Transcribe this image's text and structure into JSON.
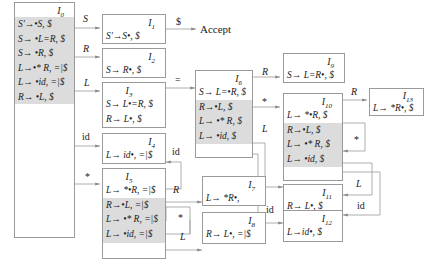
{
  "diagram": {
    "type": "LR(1) automaton",
    "accept_label": "Accept",
    "states": [
      {
        "id": "I0",
        "name": "I",
        "sub": "0",
        "kernel": [
          "S'→•S, $"
        ],
        "closure": [
          "S→ •L=R, $",
          "S→ •R, $",
          "L→•* R, =|$",
          "L→ •id, =|$",
          "R→ •L, $"
        ]
      },
      {
        "id": "I1",
        "name": "I",
        "sub": "1",
        "kernel": [
          "S'→S•, $"
        ],
        "closure": []
      },
      {
        "id": "I2",
        "name": "I",
        "sub": "2",
        "kernel": [
          "S→ R•, $"
        ],
        "closure": []
      },
      {
        "id": "I3",
        "name": "I",
        "sub": "3",
        "kernel": [
          "S→ L•=R, $",
          "R→ L•, $"
        ],
        "closure": []
      },
      {
        "id": "I4",
        "name": "I",
        "sub": "4",
        "kernel": [
          "L→ id•, =|$"
        ],
        "closure": []
      },
      {
        "id": "I5",
        "name": "I",
        "sub": "5",
        "kernel": [
          "L→ *•R, =|$"
        ],
        "closure": [
          "R→•L, =|$",
          "L→ •* R, =|$",
          "L→ •id, =|$"
        ]
      },
      {
        "id": "I6",
        "name": "I",
        "sub": "6",
        "kernel": [
          "S→ L=•R, $"
        ],
        "closure": [
          "R→•L, $",
          "L→ •* R, $",
          "L→ •id, $"
        ]
      },
      {
        "id": "I7",
        "name": "I",
        "sub": "7",
        "kernel": [
          "L→ *R•,"
        ],
        "closure": []
      },
      {
        "id": "I8",
        "name": "I",
        "sub": "8",
        "kernel": [
          "R→ L•, =|$"
        ],
        "closure": []
      },
      {
        "id": "I9",
        "name": "I",
        "sub": "9",
        "kernel": [
          "S→ L=R•, $"
        ],
        "closure": []
      },
      {
        "id": "I10",
        "name": "I",
        "sub": "10",
        "kernel": [
          "L→ *•R, $"
        ],
        "closure": [
          "R→•L, $",
          "L→ •* R, $",
          "L→ •id, $"
        ]
      },
      {
        "id": "I11",
        "name": "I",
        "sub": "11",
        "kernel": [
          "R→ L•, $"
        ],
        "closure": []
      },
      {
        "id": "I12",
        "name": "I",
        "sub": "12",
        "kernel": [
          "L→id•, $"
        ],
        "closure": []
      },
      {
        "id": "I13",
        "name": "I",
        "sub": "13",
        "kernel": [
          "L→ *R•, $"
        ],
        "closure": []
      }
    ],
    "transitions": [
      {
        "from": "I0",
        "to": "I1",
        "symbol": "S"
      },
      {
        "from": "I0",
        "to": "I2",
        "symbol": "R"
      },
      {
        "from": "I0",
        "to": "I3",
        "symbol": "L"
      },
      {
        "from": "I0",
        "to": "I4",
        "symbol": "id"
      },
      {
        "from": "I0",
        "to": "I5",
        "symbol": "*"
      },
      {
        "from": "I1",
        "to": "Accept",
        "symbol": "$"
      },
      {
        "from": "I3",
        "to": "I6",
        "symbol": "="
      },
      {
        "from": "I5",
        "to": "I4",
        "symbol": "id"
      },
      {
        "from": "I5",
        "to": "I7",
        "symbol": "R"
      },
      {
        "from": "I5",
        "to": "I5",
        "symbol": "*"
      },
      {
        "from": "I5",
        "to": "I8",
        "symbol": "L"
      },
      {
        "from": "I6",
        "to": "I9",
        "symbol": "R"
      },
      {
        "from": "I6",
        "to": "I10",
        "symbol": "*"
      },
      {
        "from": "I6",
        "to": "I11",
        "symbol": "L"
      },
      {
        "from": "I6",
        "to": "I12",
        "symbol": "id"
      },
      {
        "from": "I10",
        "to": "I13",
        "symbol": "R"
      },
      {
        "from": "I10",
        "to": "I10",
        "symbol": "*"
      },
      {
        "from": "I10",
        "to": "I11",
        "symbol": "L"
      },
      {
        "from": "I10",
        "to": "I12",
        "symbol": "id"
      }
    ]
  }
}
